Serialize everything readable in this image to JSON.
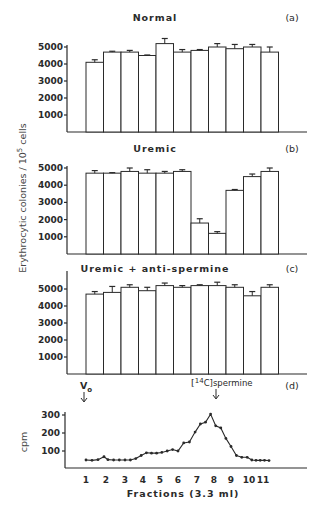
{
  "figure": {
    "y_axis_label": "Erythrocytic colonies / 10",
    "y_axis_label_sup": "5",
    "y_axis_label_tail": " cells",
    "x_axis_label": "Fractions (3.3 ml)",
    "marker_vo": "V",
    "marker_vo_sub": "o",
    "marker_spermine_pre": "[",
    "marker_spermine_sup": "14",
    "marker_spermine_post": "C]spermine"
  },
  "chart_data": [
    {
      "type": "bar",
      "panel": "(a)",
      "title": "Normal",
      "ylabel": "Erythrocytic colonies / 10^5 cells",
      "yticks": [
        1000,
        2000,
        3000,
        4000,
        5000
      ],
      "ylim": [
        0,
        5500
      ],
      "categories": [
        "1",
        "2",
        "3",
        "4",
        "5",
        "6",
        "7",
        "8",
        "9",
        "10",
        "11"
      ],
      "values": [
        4100,
        4700,
        4700,
        4500,
        5200,
        4700,
        4800,
        5000,
        4900,
        5000,
        4700
      ],
      "errors": [
        150,
        50,
        100,
        30,
        300,
        150,
        50,
        200,
        250,
        150,
        300
      ]
    },
    {
      "type": "bar",
      "panel": "(b)",
      "title": "Uremic",
      "ylabel": "Erythrocytic colonies / 10^5 cells",
      "yticks": [
        1000,
        2000,
        3000,
        4000,
        5000
      ],
      "ylim": [
        0,
        5500
      ],
      "categories": [
        "1",
        "2",
        "3",
        "4",
        "5",
        "6",
        "7",
        "8",
        "9",
        "10",
        "11"
      ],
      "values": [
        4700,
        4700,
        4800,
        4700,
        4700,
        4800,
        1800,
        1200,
        3700,
        4500,
        4800
      ],
      "errors": [
        150,
        30,
        200,
        200,
        100,
        100,
        250,
        100,
        50,
        150,
        200
      ]
    },
    {
      "type": "bar",
      "panel": "(c)",
      "title": "Uremic + anti-spermine",
      "ylabel": "Erythrocytic colonies / 10^5 cells",
      "yticks": [
        1000,
        2000,
        3000,
        4000,
        5000
      ],
      "ylim": [
        0,
        5800
      ],
      "categories": [
        "1",
        "2",
        "3",
        "4",
        "5",
        "6",
        "7",
        "8",
        "9",
        "10",
        "11"
      ],
      "values": [
        4700,
        4800,
        5100,
        4900,
        5200,
        5100,
        5200,
        5200,
        5100,
        4600,
        5100
      ],
      "errors": [
        150,
        350,
        150,
        200,
        150,
        100,
        50,
        200,
        150,
        250,
        150
      ]
    },
    {
      "type": "line",
      "panel": "(d)",
      "title": "",
      "xlabel": "Fractions (3.3 ml)",
      "ylabel": "cpm",
      "yticks": [
        100,
        200,
        300
      ],
      "xticks": [
        "1",
        "2",
        "3",
        "4",
        "5",
        "6",
        "7",
        "8",
        "9",
        "10",
        "11"
      ],
      "annotations": [
        "Vo (arrow at fraction 1)",
        "[14C]spermine (arrow at fraction ~8.2)"
      ],
      "x": [
        1.0,
        1.3,
        1.6,
        1.9,
        2.1,
        2.4,
        2.7,
        3.0,
        3.3,
        3.6,
        3.9,
        4.2,
        4.5,
        4.8,
        5.1,
        5.4,
        5.7,
        6.0,
        6.3,
        6.6,
        6.9,
        7.2,
        7.5,
        7.8,
        8.1,
        8.4,
        8.7,
        9.0,
        9.3,
        9.6,
        9.9,
        10.2,
        10.5,
        10.8,
        11.1,
        11.4
      ],
      "values": [
        50,
        48,
        52,
        68,
        52,
        50,
        50,
        50,
        50,
        58,
        75,
        90,
        88,
        88,
        92,
        100,
        108,
        100,
        145,
        150,
        205,
        250,
        260,
        305,
        240,
        228,
        170,
        125,
        75,
        65,
        65,
        50,
        48,
        48,
        48,
        47
      ],
      "ylim": [
        0,
        320
      ]
    }
  ]
}
